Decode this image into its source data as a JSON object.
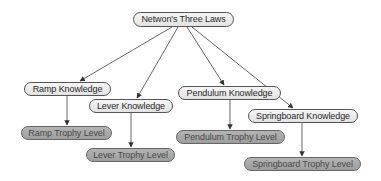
{
  "diagram": {
    "type": "concept-map",
    "nodes": {
      "root": {
        "label": "Netwon's Three Laws",
        "kind": "concept"
      },
      "ramp": {
        "label": "Ramp Knowledge",
        "kind": "concept"
      },
      "lever": {
        "label": "Lever Knowledge",
        "kind": "concept"
      },
      "pendulum": {
        "label": "Pendulum Knowledge",
        "kind": "concept"
      },
      "springboard": {
        "label": "Springboard Knowledge",
        "kind": "concept"
      },
      "ramp_trophy": {
        "label": "Ramp Trophy Level",
        "kind": "trophy"
      },
      "lever_trophy": {
        "label": "Lever Trophy Level",
        "kind": "trophy"
      },
      "pendulum_trophy": {
        "label": "Pendulum Trophy Level",
        "kind": "trophy"
      },
      "springboard_trophy": {
        "label": "Springboard Trophy Level",
        "kind": "trophy"
      }
    },
    "edges": [
      {
        "from": "root",
        "to": "ramp"
      },
      {
        "from": "root",
        "to": "lever"
      },
      {
        "from": "root",
        "to": "pendulum"
      },
      {
        "from": "root",
        "to": "springboard"
      },
      {
        "from": "ramp",
        "to": "ramp_trophy"
      },
      {
        "from": "lever",
        "to": "lever_trophy"
      },
      {
        "from": "pendulum",
        "to": "pendulum_trophy"
      },
      {
        "from": "springboard",
        "to": "springboard_trophy"
      }
    ],
    "colors": {
      "concept_fill": "#eeeeee",
      "trophy_fill": "#a8a8a8",
      "edge": "#444444"
    }
  }
}
